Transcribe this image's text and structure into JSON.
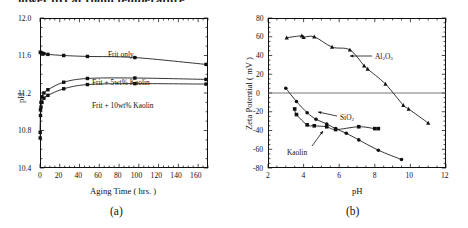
{
  "figure": {
    "cut_header_text": "lower pH at room temperature.",
    "panel_a_caption": "(a)",
    "panel_b_caption": "(b)"
  },
  "chart_data": [
    {
      "type": "line",
      "panel": "(a)",
      "title": "",
      "xlabel": "Aging Time ( hrs. )",
      "ylabel": "pH",
      "xlim": [
        0,
        170
      ],
      "ylim": [
        10.4,
        12.0
      ],
      "xticks": [
        0,
        20,
        40,
        60,
        80,
        100,
        120,
        140,
        160
      ],
      "yticks": [
        "10.4",
        "10.8",
        "11.2",
        "11.6",
        "12.0"
      ],
      "grid": false,
      "legend_position": "inline-annotations",
      "series": [
        {
          "name": "Frit only",
          "marker": "square",
          "label_text": "Frit only",
          "x": [
            0.3,
            1,
            2,
            4,
            8,
            24,
            48,
            96,
            168
          ],
          "y": [
            11.635,
            11.63,
            11.625,
            11.62,
            11.612,
            11.6,
            11.59,
            11.578,
            11.505
          ]
        },
        {
          "name": "Frit + 5wt% Kaolin",
          "marker": "square",
          "label_text": "Frit + 5wt% Kaolin",
          "x": [
            0.2,
            0.5,
            1,
            2,
            4,
            8,
            24,
            48,
            96,
            168
          ],
          "y": [
            10.78,
            11.02,
            11.1,
            11.16,
            11.2,
            11.235,
            11.315,
            11.355,
            11.36,
            11.345
          ]
        },
        {
          "name": "Frit + 10wt% Kaolin",
          "marker": "square",
          "label_text": "Frit + 10wt% Kaolin",
          "x": [
            0.2,
            0.5,
            1,
            2,
            4,
            8,
            24,
            48,
            96,
            168
          ],
          "y": [
            10.72,
            10.96,
            11.05,
            11.1,
            11.145,
            11.175,
            11.245,
            11.29,
            11.3,
            11.295
          ]
        }
      ]
    },
    {
      "type": "scatter",
      "panel": "(b)",
      "title": "",
      "xlabel": "pH",
      "ylabel": "Zeta Potential ( mV )",
      "xlim": [
        2,
        12
      ],
      "ylim": [
        -80,
        80
      ],
      "xticks": [
        2,
        4,
        6,
        8,
        10,
        12
      ],
      "yticks": [
        -80,
        -60,
        -40,
        -20,
        0,
        20,
        40,
        60,
        80
      ],
      "grid": false,
      "zero_line": true,
      "legend_position": "inline-annotations",
      "series": [
        {
          "name": "Al2O3",
          "label_text": "Al₂O₃",
          "marker": "triangle",
          "x": [
            3.05,
            3.9,
            4.0,
            4.6,
            5.6,
            6.6,
            7.4,
            7.6,
            8.6,
            9.6,
            9.9,
            11.0
          ],
          "y": [
            59,
            61,
            59.5,
            60,
            49,
            46,
            29,
            25.5,
            9.5,
            -13,
            -17,
            -32
          ]
        },
        {
          "name": "SiO2",
          "label_text": "SiO₂",
          "marker": "circle",
          "x": [
            3.0,
            3.6,
            4.2,
            4.7,
            5.3,
            5.8,
            6.4,
            7.1,
            8.2,
            9.5
          ],
          "y": [
            5,
            -9,
            -21,
            -28,
            -33,
            -38,
            -43,
            -50,
            -61,
            -71
          ]
        },
        {
          "name": "Kaolin",
          "label_text": "Kaolin",
          "marker": "square",
          "x": [
            3.5,
            3.6,
            4.2,
            4.6,
            5.3,
            5.8,
            7.1,
            8.0,
            8.2
          ],
          "y": [
            -17,
            -23,
            -34,
            -35,
            -36,
            -39,
            -36,
            -38,
            -38
          ]
        }
      ]
    }
  ]
}
